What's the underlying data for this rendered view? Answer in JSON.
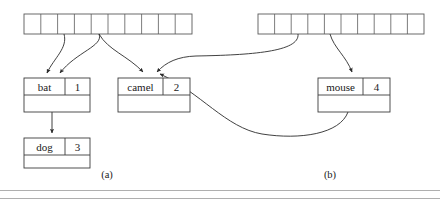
{
  "figure": {
    "caption_a": "(a)",
    "caption_b": "(b)",
    "background_color": "#ffffff",
    "line_color": "#2b2b2b",
    "box_stroke_color": "#3c3c3c",
    "slot_stroke_color": "#5a5a5a"
  },
  "panel_a": {
    "label": "(a)",
    "table": {
      "name": "hash-table-a",
      "slot_count": 10,
      "slots": [
        "",
        "",
        "",
        "",
        "",
        "",
        "",
        "",
        "",
        ""
      ],
      "x": 24,
      "y": 14,
      "width": 168,
      "height": 20
    },
    "nodes": [
      {
        "id": "node-bat",
        "key": "bat",
        "value": "1",
        "x": 24,
        "y": 78,
        "width": 66,
        "height": 34
      },
      {
        "id": "node-dog",
        "key": "dog",
        "value": "3",
        "x": 24,
        "y": 138,
        "width": 66,
        "height": 30
      },
      {
        "id": "node-camel",
        "key": "camel",
        "value": "2",
        "x": 118,
        "y": 78,
        "width": 72,
        "height": 34
      }
    ]
  },
  "panel_b": {
    "label": "(b)",
    "table": {
      "name": "hash-table-b",
      "slot_count": 10,
      "slots": [
        "",
        "",
        "",
        "",
        "",
        "",
        "",
        "",
        "",
        ""
      ],
      "x": 258,
      "y": 14,
      "width": 166,
      "height": 20
    },
    "nodes": [
      {
        "id": "node-mouse",
        "key": "mouse",
        "value": "4",
        "x": 318,
        "y": 78,
        "width": 72,
        "height": 34
      }
    ]
  },
  "links": [
    {
      "name": "link-a-slot3-to-bat",
      "from": "hash-table-a.slot.3",
      "to": "node-bat"
    },
    {
      "name": "link-a-slot5-to-bat",
      "from": "hash-table-a.slot.5",
      "to": "node-bat"
    },
    {
      "name": "link-a-slot5-to-camel",
      "from": "hash-table-a.slot.5",
      "to": "node-camel"
    },
    {
      "name": "link-bat-to-dog",
      "from": "node-bat.next",
      "to": "node-dog"
    },
    {
      "name": "link-b-slot3-to-camel",
      "from": "hash-table-b.slot.3",
      "to": "node-camel"
    },
    {
      "name": "link-b-slot5-to-mouse",
      "from": "hash-table-b.slot.5",
      "to": "node-mouse"
    },
    {
      "name": "link-mouse-to-camel",
      "from": "node-mouse.next",
      "to": "node-camel"
    }
  ]
}
